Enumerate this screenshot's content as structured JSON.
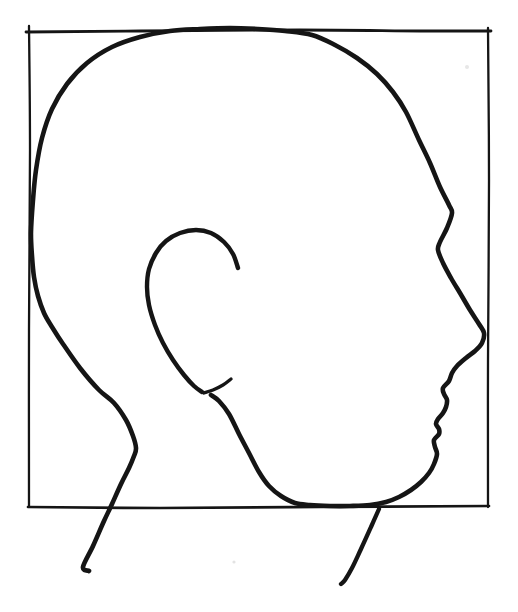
{
  "canvas": {
    "width": 518,
    "height": 612,
    "background": "#ffffff",
    "ink": "#151515"
  },
  "sketch": {
    "subject": "hand-drawn human head in right-facing profile inscribed in a square construction frame, neck strokes extending below the frame",
    "strokes": [
      {
        "name": "frame-left-line",
        "width": 2.3,
        "points": [
          [
            29,
            26
          ],
          [
            30,
            150
          ],
          [
            29,
            330
          ],
          [
            29,
            506
          ]
        ]
      },
      {
        "name": "frame-top-line",
        "width": 2.8,
        "points": [
          [
            26,
            32
          ],
          [
            140,
            31
          ],
          [
            300,
            30
          ],
          [
            420,
            31
          ],
          [
            491,
            31
          ]
        ]
      },
      {
        "name": "frame-right-line",
        "width": 2.3,
        "points": [
          [
            488,
            28
          ],
          [
            489,
            180
          ],
          [
            488,
            360
          ],
          [
            488,
            507
          ]
        ]
      },
      {
        "name": "frame-bottom-line",
        "width": 2.7,
        "points": [
          [
            28,
            507
          ],
          [
            160,
            508
          ],
          [
            320,
            507
          ],
          [
            489,
            506
          ]
        ]
      },
      {
        "name": "head-outline",
        "width": 4.6,
        "points": [
          [
            89,
            571
          ],
          [
            83,
            567
          ],
          [
            93,
            546
          ],
          [
            104,
            521
          ],
          [
            112,
            504
          ],
          [
            121,
            484
          ],
          [
            129,
            468
          ],
          [
            134,
            456
          ],
          [
            136,
            448
          ],
          [
            133,
            436
          ],
          [
            126,
            420
          ],
          [
            114,
            403
          ],
          [
            99,
            390
          ],
          [
            80,
            368
          ],
          [
            63,
            344
          ],
          [
            52,
            327
          ],
          [
            44,
            313
          ],
          [
            38,
            296
          ],
          [
            34,
            277
          ],
          [
            32,
            256
          ],
          [
            31,
            232
          ],
          [
            33,
            200
          ],
          [
            36,
            170
          ],
          [
            42,
            138
          ],
          [
            52,
            109
          ],
          [
            67,
            84
          ],
          [
            87,
            63
          ],
          [
            112,
            47
          ],
          [
            140,
            37
          ],
          [
            170,
            31
          ],
          [
            200,
            29
          ],
          [
            230,
            28
          ],
          [
            258,
            29
          ],
          [
            285,
            31
          ],
          [
            312,
            35
          ],
          [
            335,
            45
          ],
          [
            357,
            58
          ],
          [
            377,
            74
          ],
          [
            393,
            92
          ],
          [
            406,
            112
          ],
          [
            419,
            140
          ],
          [
            430,
            163
          ],
          [
            440,
            187
          ],
          [
            449,
            205
          ],
          [
            452,
            213
          ],
          [
            447,
            228
          ],
          [
            440,
            242
          ],
          [
            438,
            250
          ],
          [
            443,
            263
          ],
          [
            451,
            278
          ],
          [
            460,
            293
          ],
          [
            470,
            310
          ],
          [
            479,
            324
          ],
          [
            484,
            333
          ],
          [
            482,
            343
          ],
          [
            475,
            351
          ],
          [
            466,
            358
          ],
          [
            457,
            366
          ],
          [
            452,
            373
          ],
          [
            449,
            381
          ],
          [
            443,
            388
          ],
          [
            444,
            394
          ],
          [
            447,
            400
          ],
          [
            446,
            407
          ],
          [
            443,
            413
          ],
          [
            438,
            419
          ],
          [
            436,
            424
          ],
          [
            439,
            429
          ],
          [
            439,
            434
          ],
          [
            434,
            440
          ],
          [
            435,
            447
          ],
          [
            437,
            454
          ],
          [
            434,
            464
          ],
          [
            429,
            473
          ],
          [
            421,
            482
          ],
          [
            411,
            490
          ],
          [
            399,
            497
          ],
          [
            386,
            502
          ],
          [
            370,
            505
          ],
          [
            350,
            506
          ],
          [
            330,
            506
          ],
          [
            310,
            505
          ],
          [
            295,
            503
          ],
          [
            281,
            496
          ],
          [
            269,
            486
          ],
          [
            259,
            472
          ],
          [
            249,
            453
          ],
          [
            239,
            434
          ],
          [
            229,
            414
          ],
          [
            219,
            401
          ],
          [
            211,
            395
          ]
        ]
      },
      {
        "name": "ear-outline",
        "width": 4.4,
        "points": [
          [
            238,
            268
          ],
          [
            233,
            254
          ],
          [
            224,
            242
          ],
          [
            211,
            233
          ],
          [
            196,
            230
          ],
          [
            180,
            233
          ],
          [
            166,
            241
          ],
          [
            156,
            253
          ],
          [
            149,
            269
          ],
          [
            147,
            287
          ],
          [
            149,
            305
          ],
          [
            155,
            325
          ],
          [
            163,
            343
          ],
          [
            173,
            360
          ],
          [
            184,
            375
          ],
          [
            194,
            386
          ],
          [
            202,
            392
          ]
        ]
      },
      {
        "name": "ear-lobe-hook",
        "width": 3.4,
        "points": [
          [
            204,
            393
          ],
          [
            213,
            390
          ],
          [
            223,
            385
          ],
          [
            231,
            379
          ]
        ]
      },
      {
        "name": "neck-front-line",
        "width": 4.3,
        "points": [
          [
            379,
            509
          ],
          [
            371,
            527
          ],
          [
            361,
            549
          ],
          [
            352,
            568
          ],
          [
            345,
            580
          ],
          [
            341,
            584
          ]
        ]
      }
    ],
    "specks": [
      {
        "x": 467,
        "y": 67,
        "r": 2.0,
        "color": "#e7e7e7"
      },
      {
        "x": 234,
        "y": 562,
        "r": 1.6,
        "color": "#e3e3e3"
      }
    ]
  }
}
